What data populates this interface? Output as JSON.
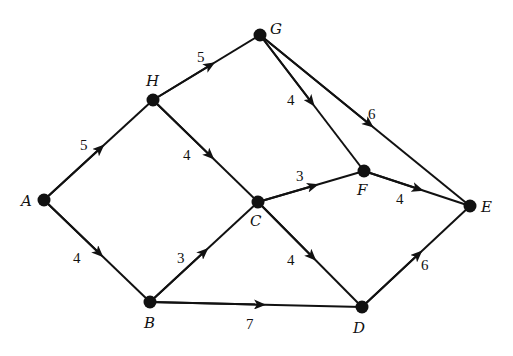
{
  "diagram": {
    "type": "weighted directed graph",
    "nodes": [
      {
        "id": "A",
        "label": "A",
        "x": 44,
        "y": 200
      },
      {
        "id": "H",
        "label": "H",
        "x": 153,
        "y": 100
      },
      {
        "id": "G",
        "label": "G",
        "x": 260,
        "y": 35
      },
      {
        "id": "C",
        "label": "C",
        "x": 258,
        "y": 202
      },
      {
        "id": "F",
        "label": "F",
        "x": 364,
        "y": 171
      },
      {
        "id": "E",
        "label": "E",
        "x": 470,
        "y": 206
      },
      {
        "id": "B",
        "label": "B",
        "x": 150,
        "y": 302
      },
      {
        "id": "D",
        "label": "D",
        "x": 362,
        "y": 307
      }
    ],
    "edges": [
      {
        "from": "A",
        "to": "H",
        "weight": "5"
      },
      {
        "from": "A",
        "to": "B",
        "weight": "4"
      },
      {
        "from": "H",
        "to": "G",
        "weight": "5"
      },
      {
        "from": "H",
        "to": "C",
        "weight": "4"
      },
      {
        "from": "G",
        "to": "F",
        "weight": "4"
      },
      {
        "from": "G",
        "to": "E",
        "weight": "6"
      },
      {
        "from": "B",
        "to": "C",
        "weight": "3"
      },
      {
        "from": "B",
        "to": "D",
        "weight": "7"
      },
      {
        "from": "C",
        "to": "F",
        "weight": "3"
      },
      {
        "from": "C",
        "to": "D",
        "weight": "4"
      },
      {
        "from": "F",
        "to": "E",
        "weight": "4"
      },
      {
        "from": "D",
        "to": "E",
        "weight": "6"
      }
    ]
  }
}
